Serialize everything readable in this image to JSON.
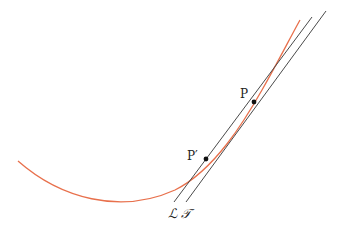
{
  "diagram": {
    "colors": {
      "curve": "#e8704c",
      "lines": "#4a4a4a",
      "points": "#111111",
      "labels": "#222222"
    },
    "curve": {
      "path": "M18,161 C60,198 120,215 175,190 C215,170 245,120 262,90 C278,62 290,38 300,20"
    },
    "lines": [
      {
        "id": "L",
        "label": "ℒ",
        "x1": 174,
        "y1": 202,
        "x2": 312,
        "y2": 17
      },
      {
        "id": "T",
        "label": "𝒯",
        "x1": 186,
        "y1": 202,
        "x2": 326,
        "y2": 11
      }
    ],
    "points": [
      {
        "id": "P",
        "label": "P",
        "x": 254,
        "y": 102,
        "label_x": 240,
        "label_y": 98
      },
      {
        "id": "P_prime",
        "label": "P′",
        "x": 206,
        "y": 159,
        "label_x": 187,
        "label_y": 160
      }
    ],
    "line_labels": [
      {
        "id": "L",
        "text": "ℒ",
        "x": 168,
        "y": 218
      },
      {
        "id": "T",
        "text": "𝒯",
        "x": 181,
        "y": 218
      }
    ]
  }
}
